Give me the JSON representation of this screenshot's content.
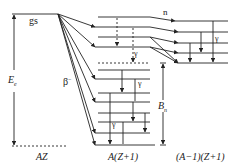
{
  "diagram": {
    "type": "energy-level-diagram",
    "labels": {
      "ground_state": "gs",
      "decay_energy": "E",
      "decay_energy_sub": "e",
      "beta": "β",
      "beta_sup": "−",
      "neutron": "n",
      "gamma": "γ",
      "binding": "B",
      "binding_sub": "n"
    },
    "nuclei": {
      "parent": "AZ",
      "daughter": "A(Z+1)",
      "final": "(A−1)(Z+1)"
    },
    "colors": {
      "line": "#222222",
      "background": "#ffffff"
    }
  }
}
